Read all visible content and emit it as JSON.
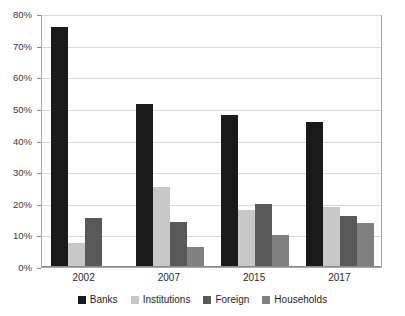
{
  "chart_data": {
    "type": "bar",
    "title": "",
    "subtitle": "",
    "xlabel": "",
    "ylabel": "",
    "categories": [
      "2002",
      "2007",
      "2015",
      "2017"
    ],
    "series": [
      {
        "name": "Banks",
        "color": "#1a1a1a",
        "values": [
          76.0,
          51.5,
          48.1,
          46.0
        ]
      },
      {
        "name": "Institutions",
        "color": "#c8c8c8",
        "values": [
          7.6,
          25.3,
          18.0,
          19.0
        ]
      },
      {
        "name": "Foreign",
        "color": "#595959",
        "values": [
          15.5,
          14.2,
          20.0,
          16.0
        ]
      },
      {
        "name": "Households",
        "color": "#808080",
        "values": [
          0.0,
          6.3,
          10.1,
          14.0
        ]
      }
    ],
    "ylim": [
      0,
      80
    ],
    "y_ticks": [
      0,
      10,
      20,
      30,
      40,
      50,
      60,
      70,
      80
    ],
    "y_tick_labels": [
      "0%",
      "10%",
      "20%",
      "30%",
      "40%",
      "50%",
      "60%",
      "70%",
      "80%"
    ],
    "grid": true,
    "legend_position": "bottom"
  },
  "legend": {
    "items": [
      {
        "label": "Banks"
      },
      {
        "label": "Institutions"
      },
      {
        "label": "Foreign"
      },
      {
        "label": "Households"
      }
    ]
  }
}
